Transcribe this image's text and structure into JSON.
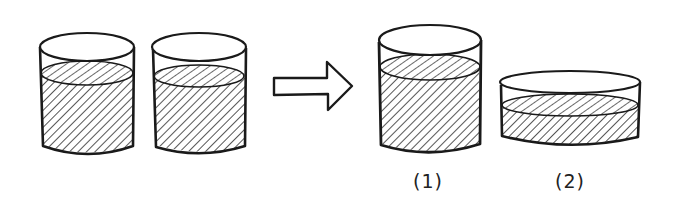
{
  "diagram": {
    "stroke_color": "#1a1a1a",
    "fill_color": "#ffffff",
    "hatch_color": "#2a2a2a",
    "before": {
      "containers": [
        {
          "id": "cup-a",
          "shape": "tall-cylinder",
          "liquid": "partially-filled"
        },
        {
          "id": "cup-b",
          "shape": "tall-cylinder",
          "liquid": "partially-filled"
        }
      ]
    },
    "transition": {
      "icon": "right-arrow-icon",
      "meaning": "becomes / is poured into"
    },
    "after": {
      "options": [
        {
          "label": "(1)",
          "shape": "tall-cylinder",
          "liquid": "partially-filled"
        },
        {
          "label": "(2)",
          "shape": "wide-shallow-dish",
          "liquid": "partially-filled"
        }
      ]
    }
  }
}
